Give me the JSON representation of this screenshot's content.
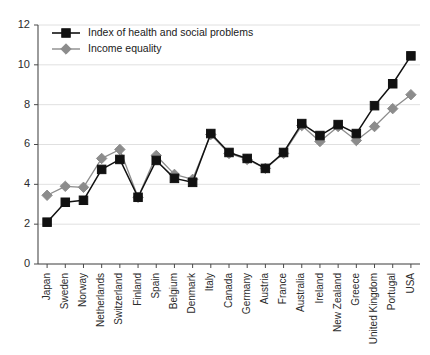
{
  "chart_data": {
    "type": "line",
    "title": "",
    "xlabel": "",
    "ylabel": "",
    "ylim": [
      0,
      12
    ],
    "ytick_values": [
      0,
      2,
      4,
      6,
      8,
      10,
      12
    ],
    "ytick_labels": [
      "0",
      "2",
      "4",
      "6",
      "8",
      "10",
      "12"
    ],
    "grid": true,
    "legend_position": "top-left",
    "categories": [
      "Japan",
      "Sweden",
      "Norway",
      "Netherlands",
      "Switzerland",
      "Finland",
      "Spain",
      "Belgium",
      "Denmark",
      "Italy",
      "Canada",
      "Germany",
      "Austria",
      "France",
      "Australia",
      "Ireland",
      "New Zealand",
      "Greece",
      "United Kingdom",
      "Portugal",
      "USA"
    ],
    "series": [
      {
        "name": "Index of health and social problems",
        "color": "#111111",
        "marker": "square",
        "values": [
          2.1,
          3.1,
          3.2,
          4.75,
          5.25,
          3.35,
          5.2,
          4.3,
          4.1,
          6.55,
          5.6,
          5.3,
          4.8,
          5.6,
          7.05,
          6.45,
          7.0,
          6.55,
          7.95,
          9.05,
          10.45
        ]
      },
      {
        "name": "Income equality",
        "color": "#8c8c8c",
        "marker": "diamond",
        "values": [
          3.45,
          3.9,
          3.85,
          5.3,
          5.75,
          3.35,
          5.45,
          4.5,
          4.25,
          6.5,
          5.55,
          5.25,
          4.8,
          5.55,
          6.95,
          6.15,
          6.9,
          6.2,
          6.9,
          7.8,
          8.5
        ]
      }
    ]
  },
  "legend": {
    "entries": [
      {
        "label": "Index of health and social problems"
      },
      {
        "label": "Income equality"
      }
    ]
  }
}
